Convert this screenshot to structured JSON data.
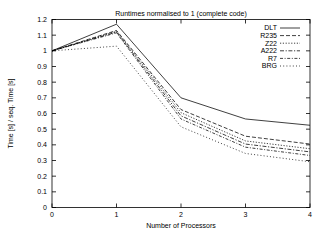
{
  "chart_data": {
    "type": "line",
    "title": "Runtimes normalised to 1 (complete code)",
    "xlabel": "Number of Processors",
    "ylabel": "Time [s] / seq. Time [s]",
    "xlim": [
      0,
      4
    ],
    "ylim": [
      0,
      1.2
    ],
    "xticks": [
      "0",
      "1",
      "2",
      "3",
      "4"
    ],
    "yticks": [
      "0",
      "0.1",
      "0.2",
      "0.3",
      "0.4",
      "0.5",
      "0.6",
      "0.7",
      "0.8",
      "0.9",
      "1",
      "1.1",
      "1.2"
    ],
    "grid": false,
    "legend_position": "top-right",
    "x": [
      0,
      1,
      2,
      3,
      4
    ],
    "series": [
      {
        "name": "DLT",
        "dash": "solid",
        "values": [
          1.0,
          1.17,
          0.7,
          0.565,
          0.525
        ]
      },
      {
        "name": "R235",
        "dash": "dashed",
        "values": [
          1.0,
          1.13,
          0.625,
          0.455,
          0.405
        ]
      },
      {
        "name": "Z22",
        "dash": "dotted",
        "values": [
          1.0,
          1.125,
          0.605,
          0.425,
          0.375
        ]
      },
      {
        "name": "A222",
        "dash": "dashdot",
        "values": [
          1.0,
          1.12,
          0.585,
          0.405,
          0.355
        ]
      },
      {
        "name": "R7",
        "dash": "longdash",
        "values": [
          1.0,
          1.115,
          0.565,
          0.385,
          0.332
        ]
      },
      {
        "name": "BRG",
        "dash": "finedot",
        "values": [
          1.0,
          1.03,
          0.515,
          0.345,
          0.292
        ]
      }
    ]
  }
}
